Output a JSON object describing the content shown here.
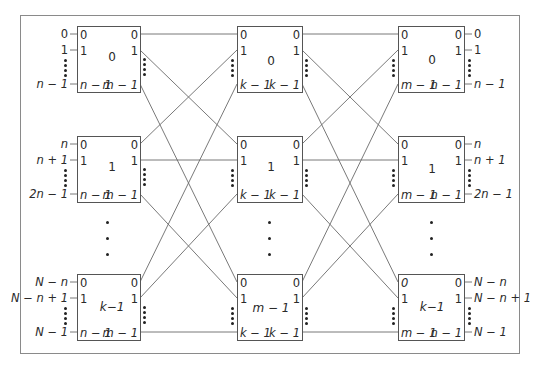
{
  "diagram": {
    "colors": {
      "line": "#6a6a6a",
      "box_border": "#555555",
      "frame": "#8a8a8a",
      "text": "#2a2a2a"
    },
    "stage1": {
      "switches": [
        {
          "id": "0",
          "in_top": "0",
          "in_second": "1",
          "in_last": "n − 1",
          "out_top": "0",
          "out_second": "1",
          "out_last": "m − 1"
        },
        {
          "id": "1",
          "in_top": "0",
          "in_second": "1",
          "in_last": "n − 1",
          "out_top": "0",
          "out_second": "1",
          "out_last": "m − 1"
        },
        {
          "id": "k−1",
          "in_top": "0",
          "in_second": "1",
          "in_last": "n − 1",
          "out_top": "0",
          "out_second": "1",
          "out_last": "m − 1"
        }
      ],
      "external_inputs": [
        {
          "top": "0",
          "second": "1",
          "last": "n − 1"
        },
        {
          "top": "n",
          "second": "n + 1",
          "last": "2n − 1"
        },
        {
          "top": "N − n",
          "second": "N − n + 1",
          "last": "N − 1"
        }
      ]
    },
    "stage2": {
      "switches": [
        {
          "id": "0",
          "in_top": "0",
          "in_second": "1",
          "in_last": "k − 1",
          "out_top": "0",
          "out_second": "1",
          "out_last": "k − 1"
        },
        {
          "id": "1",
          "in_top": "0",
          "in_second": "1",
          "in_last": "k − 1",
          "out_top": "0",
          "out_second": "1",
          "out_last": "k − 1"
        },
        {
          "id": "m − 1",
          "in_top": "0",
          "in_second": "1",
          "in_last": "k − 1",
          "out_top": "0",
          "out_second": "1",
          "out_last": "k − 1"
        }
      ]
    },
    "stage3": {
      "switches": [
        {
          "id": "0",
          "in_top": "0",
          "in_second": "1",
          "in_last": "m − 1",
          "out_top": "0",
          "out_second": "1",
          "out_last": "n − 1"
        },
        {
          "id": "1",
          "in_top": "0",
          "in_second": "1",
          "in_last": "m − 1",
          "out_top": "0",
          "out_second": "1",
          "out_last": "n − 1"
        },
        {
          "id": "k−1",
          "in_top": "0",
          "in_second": "1",
          "in_last": "m − 1",
          "out_top": "0",
          "out_second": "1",
          "out_last": "n − 1"
        }
      ],
      "external_outputs": [
        {
          "top": "0",
          "second": "1",
          "last": "n − 1"
        },
        {
          "top": "n",
          "second": "n + 1",
          "last": "2n − 1"
        },
        {
          "top": "N − n",
          "second": "N − n + 1",
          "last": "N − 1"
        }
      ]
    },
    "ellipsis": "⋮"
  }
}
